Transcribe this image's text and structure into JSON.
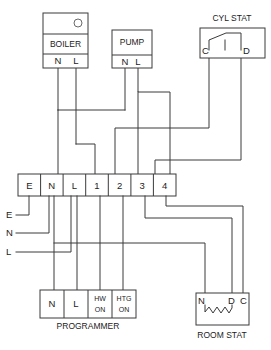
{
  "diagram": {
    "line_color": "#3a3a3a",
    "text_color": "#1c1c1c",
    "background": "#ffffff"
  },
  "boiler": {
    "name": "BOILER",
    "indicator": "circle-indicator",
    "terminals": [
      {
        "label": "N"
      },
      {
        "label": "L"
      }
    ]
  },
  "pump": {
    "name": "PUMP",
    "terminals": [
      {
        "label": "N"
      },
      {
        "label": "L"
      }
    ]
  },
  "cyl_stat": {
    "name": "CYL STAT",
    "terminals": [
      {
        "label": "C"
      },
      {
        "label": "D"
      }
    ]
  },
  "room_stat": {
    "name": "ROOM STAT",
    "terminals": [
      {
        "label": "N"
      },
      {
        "label": "D"
      },
      {
        "label": "C"
      }
    ]
  },
  "junction_box": {
    "name": "terminal-strip",
    "terminals": [
      {
        "label": "E"
      },
      {
        "label": "N"
      },
      {
        "label": "L"
      },
      {
        "label": "1"
      },
      {
        "label": "2"
      },
      {
        "label": "3"
      },
      {
        "label": "4"
      }
    ]
  },
  "programmer": {
    "name": "PROGRAMMER",
    "terminals": [
      {
        "label": "N",
        "line2": ""
      },
      {
        "label": "L",
        "line2": ""
      },
      {
        "label": "HW",
        "line2": "ON"
      },
      {
        "label": "HTG",
        "line2": "ON"
      }
    ]
  },
  "supply": {
    "labels": [
      {
        "label": "E"
      },
      {
        "label": "N"
      },
      {
        "label": "L"
      }
    ]
  }
}
